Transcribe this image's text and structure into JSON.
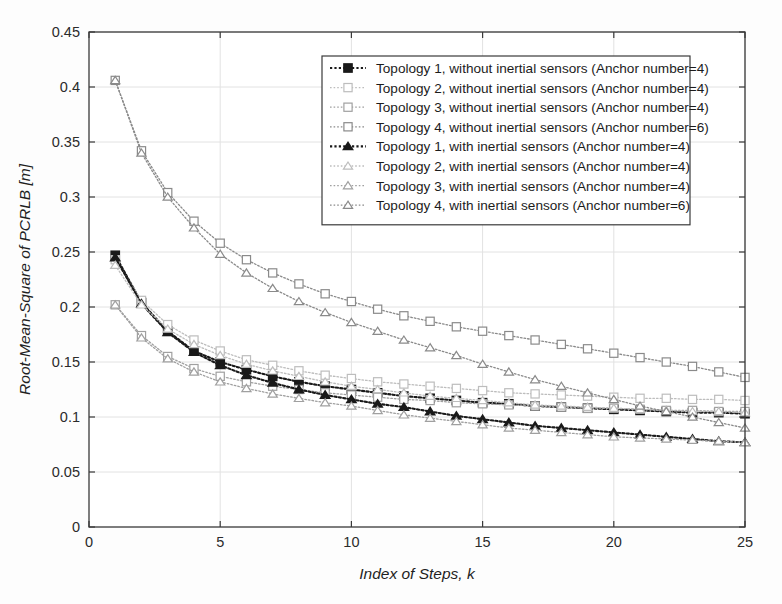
{
  "chart_data": {
    "type": "line",
    "title": "",
    "xlabel": "Index of Steps, k",
    "ylabel": "Root-Mean-Square of PCRLB [m]",
    "xlim": [
      0,
      25
    ],
    "ylim": [
      0,
      0.45
    ],
    "xticks": [
      0,
      5,
      10,
      15,
      20,
      25
    ],
    "yticks": [
      0,
      0.05,
      0.1,
      0.15,
      0.2,
      0.25,
      0.3,
      0.35,
      0.4,
      0.45
    ],
    "xticklabels": [
      "0",
      "5",
      "10",
      "15",
      "20",
      "25"
    ],
    "yticklabels": [
      "0",
      "0.05",
      "0.1",
      "0.15",
      "0.2",
      "0.25",
      "0.3",
      "0.35",
      "0.4",
      "0.45"
    ],
    "grid": true,
    "legend_position": "upper right",
    "x": [
      1,
      2,
      3,
      4,
      5,
      6,
      7,
      8,
      9,
      10,
      11,
      12,
      13,
      14,
      15,
      16,
      17,
      18,
      19,
      20,
      21,
      22,
      23,
      24,
      25
    ],
    "series": [
      {
        "name": "Topology 1, without inertial sensors (Anchor number=4)",
        "marker": "square",
        "linestyle": "dotted",
        "color": "#1a1a1a",
        "values": [
          0.247,
          0.204,
          0.178,
          0.16,
          0.15,
          0.143,
          0.137,
          0.132,
          0.128,
          0.125,
          0.122,
          0.119,
          0.117,
          0.115,
          0.113,
          0.112,
          0.11,
          0.109,
          0.108,
          0.107,
          0.106,
          0.105,
          0.104,
          0.104,
          0.103
        ]
      },
      {
        "name": "Topology 2, without inertial sensors (Anchor number=4)",
        "marker": "square",
        "linestyle": "dotted",
        "color": "#bdbdbd",
        "values": [
          0.243,
          0.206,
          0.184,
          0.17,
          0.16,
          0.152,
          0.147,
          0.142,
          0.138,
          0.135,
          0.132,
          0.13,
          0.128,
          0.126,
          0.124,
          0.122,
          0.121,
          0.12,
          0.119,
          0.118,
          0.117,
          0.117,
          0.116,
          0.116,
          0.115
        ]
      },
      {
        "name": "Topology 3, without inertial sensors (Anchor number=4)",
        "marker": "square",
        "linestyle": "dotted",
        "color": "#a0a0a0",
        "values": [
          0.202,
          0.174,
          0.155,
          0.144,
          0.137,
          0.132,
          0.128,
          0.125,
          0.122,
          0.12,
          0.118,
          0.116,
          0.115,
          0.113,
          0.112,
          0.111,
          0.11,
          0.109,
          0.108,
          0.108,
          0.107,
          0.106,
          0.106,
          0.105,
          0.105
        ]
      },
      {
        "name": "Topology 4, without inertial sensors (Anchor number=6)",
        "marker": "square",
        "linestyle": "dotted",
        "color": "#8a8a8a",
        "values": [
          0.406,
          0.342,
          0.304,
          0.278,
          0.258,
          0.243,
          0.231,
          0.221,
          0.212,
          0.205,
          0.198,
          0.192,
          0.187,
          0.182,
          0.178,
          0.174,
          0.17,
          0.166,
          0.162,
          0.158,
          0.154,
          0.15,
          0.146,
          0.141,
          0.136
        ]
      },
      {
        "name": "Topology 1, with inertial sensors (Anchor number=4)",
        "marker": "triangle",
        "linestyle": "dotted",
        "color": "#1a1a1a",
        "values": [
          0.245,
          0.203,
          0.177,
          0.159,
          0.147,
          0.138,
          0.131,
          0.125,
          0.12,
          0.116,
          0.112,
          0.109,
          0.105,
          0.101,
          0.098,
          0.095,
          0.092,
          0.09,
          0.088,
          0.086,
          0.084,
          0.082,
          0.08,
          0.078,
          0.077
        ]
      },
      {
        "name": "Topology 2, with inertial sensors (Anchor number=4)",
        "marker": "triangle",
        "linestyle": "dotted",
        "color": "#bdbdbd",
        "values": [
          0.238,
          0.202,
          0.18,
          0.166,
          0.156,
          0.148,
          0.142,
          0.137,
          0.132,
          0.128,
          0.125,
          0.122,
          0.119,
          0.117,
          0.115,
          0.113,
          0.111,
          0.11,
          0.109,
          0.108,
          0.107,
          0.106,
          0.105,
          0.105,
          0.104
        ]
      },
      {
        "name": "Topology 3, with inertial sensors (Anchor number=4)",
        "marker": "triangle",
        "linestyle": "dotted",
        "color": "#a0a0a0",
        "values": [
          0.202,
          0.172,
          0.153,
          0.141,
          0.132,
          0.126,
          0.121,
          0.117,
          0.113,
          0.11,
          0.106,
          0.102,
          0.099,
          0.096,
          0.093,
          0.09,
          0.088,
          0.086,
          0.084,
          0.082,
          0.081,
          0.08,
          0.079,
          0.078,
          0.077
        ]
      },
      {
        "name": "Topology 4, with inertial sensors (Anchor number=6)",
        "marker": "triangle",
        "linestyle": "dotted",
        "color": "#8a8a8a",
        "values": [
          0.406,
          0.34,
          0.3,
          0.272,
          0.248,
          0.231,
          0.217,
          0.205,
          0.195,
          0.186,
          0.178,
          0.17,
          0.163,
          0.156,
          0.148,
          0.141,
          0.134,
          0.128,
          0.122,
          0.116,
          0.11,
          0.105,
          0.1,
          0.095,
          0.09
        ]
      }
    ]
  },
  "figure": {
    "background": "#fdfdfd",
    "axis_color": "#3a3a3a",
    "grid_color": "#e2e2e2",
    "legend_border_color": "#3a3a3a",
    "legend_background": "#ffffff"
  }
}
